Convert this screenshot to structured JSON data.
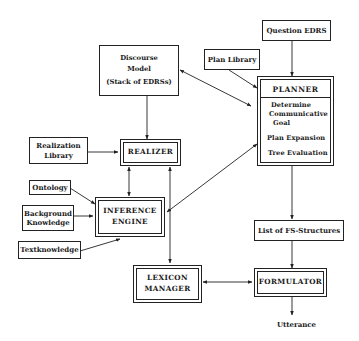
{
  "diagram": {
    "nodes": {
      "discourse_model": {
        "line1": "Discourse",
        "line2": "Model",
        "line3": "(Stack of EDRSs)"
      },
      "question_edrs": {
        "label": "Question EDRS"
      },
      "plan_library": {
        "label": "Plan Library"
      },
      "planner": {
        "title": "PLANNER",
        "items": [
          "Determine",
          "Communicative",
          "Goal",
          "Plan Expansion",
          "Tree Evaluation"
        ]
      },
      "realization_library": {
        "line1": "Realization",
        "line2": "Library"
      },
      "realizer": {
        "label": "REALIZER"
      },
      "ontology": {
        "label": "Ontology"
      },
      "background_knowledge": {
        "line1": "Background",
        "line2": "Knowledge"
      },
      "inference_engine": {
        "line1": "INFERENCE",
        "line2": "ENGINE"
      },
      "textknowledge": {
        "label": "Textknowledge"
      },
      "list_fs_structures": {
        "label": "List of FS-Structures"
      },
      "lexicon_manager": {
        "line1": "LEXICON",
        "line2": "MANAGER"
      },
      "formulator": {
        "label": "FORMULATOR"
      },
      "utterance": {
        "label": "Utterance"
      }
    },
    "edges": [
      {
        "from": "Question EDRS",
        "to": "PLANNER",
        "type": "directed"
      },
      {
        "from": "Plan Library",
        "to": "PLANNER",
        "type": "directed"
      },
      {
        "from": "PLANNER",
        "to": "Discourse Model",
        "type": "bidirectional"
      },
      {
        "from": "Discourse Model",
        "to": "REALIZER",
        "type": "directed"
      },
      {
        "from": "Realization Library",
        "to": "REALIZER",
        "type": "directed"
      },
      {
        "from": "REALIZER",
        "to": "INFERENCE ENGINE",
        "type": "bidirectional"
      },
      {
        "from": "REALIZER",
        "to": "LEXICON MANAGER",
        "type": "bidirectional"
      },
      {
        "from": "Ontology",
        "to": "INFERENCE ENGINE",
        "type": "directed"
      },
      {
        "from": "Background Knowledge",
        "to": "INFERENCE ENGINE",
        "type": "directed"
      },
      {
        "from": "Textknowledge",
        "to": "INFERENCE ENGINE",
        "type": "directed"
      },
      {
        "from": "PLANNER",
        "to": "INFERENCE ENGINE",
        "type": "bidirectional"
      },
      {
        "from": "PLANNER",
        "to": "List of FS-Structures",
        "type": "directed"
      },
      {
        "from": "List of FS-Structures",
        "to": "FORMULATOR",
        "type": "directed"
      },
      {
        "from": "LEXICON MANAGER",
        "to": "FORMULATOR",
        "type": "bidirectional"
      },
      {
        "from": "FORMULATOR",
        "to": "Utterance",
        "type": "directed"
      }
    ]
  }
}
